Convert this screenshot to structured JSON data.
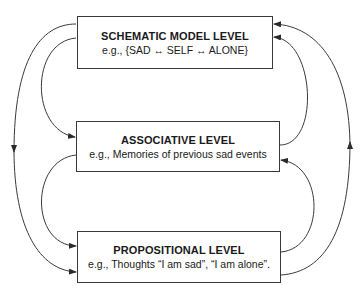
{
  "diagram": {
    "levels": [
      {
        "id": "schematic",
        "title": "SCHEMATIC MODEL LEVEL",
        "example": "e.g., {SAD ↔ SELF ↔ ALONE}"
      },
      {
        "id": "associative",
        "title": "ASSOCIATIVE LEVEL",
        "example": "e.g., Memories of previous sad events"
      },
      {
        "id": "propositional",
        "title": "PROPOSITIONAL LEVEL",
        "example": "e.g., Thoughts “I am sad”, “I am alone”."
      }
    ],
    "connections": [
      {
        "from": "schematic",
        "to": "associative",
        "side": "left"
      },
      {
        "from": "associative",
        "to": "propositional",
        "side": "left"
      },
      {
        "from": "schematic",
        "to": "propositional",
        "side": "left-outer"
      },
      {
        "from": "associative",
        "to": "schematic",
        "side": "right"
      },
      {
        "from": "propositional",
        "to": "associative",
        "side": "right"
      },
      {
        "from": "propositional",
        "to": "schematic",
        "side": "right-outer"
      }
    ],
    "colors": {
      "line": "#3a3a3a",
      "box_border": "#3a3a3a",
      "background": "#ffffff"
    }
  }
}
